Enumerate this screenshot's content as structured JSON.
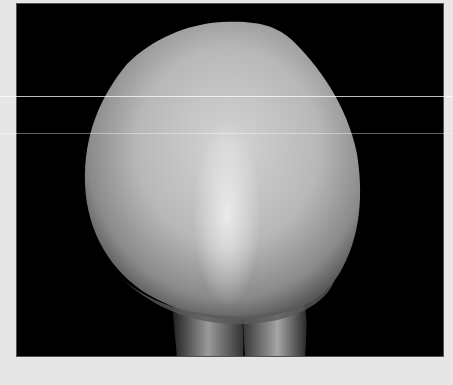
{
  "image": {
    "subject": "dental crown on black background",
    "alt": "Grayscale photograph of a tooth-shaped dental crown against a black background",
    "colors": {
      "frame_background": "#e6e6e6",
      "photo_background": "#000000",
      "crown_highlight": "#d9d9d9",
      "crown_midtone": "#a8a8a8",
      "crown_shadow": "#4a4a4a"
    }
  }
}
